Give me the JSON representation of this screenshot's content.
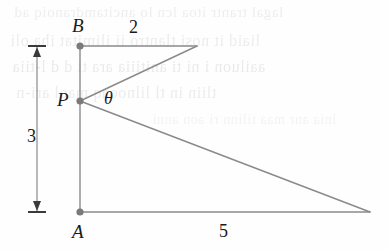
{
  "figure": {
    "background_color": "#fefefe",
    "stroke_color": "#8a8a8a",
    "dot_color": "#7a7a7a",
    "text_color": "#1a1a1a"
  },
  "points": {
    "A": {
      "label": "A",
      "x": 80,
      "y": 212,
      "label_x": 72,
      "label_y": 222
    },
    "B": {
      "label": "B",
      "x": 80,
      "y": 46,
      "label_x": 72,
      "label_y": 16
    },
    "P": {
      "label": "P",
      "x": 80,
      "y": 101,
      "label_x": 57,
      "label_y": 90
    },
    "C": {
      "label": "",
      "x": 197,
      "y": 46
    },
    "D": {
      "label": "",
      "x": 370,
      "y": 212
    }
  },
  "angle": {
    "label": "θ",
    "vertex": "P",
    "label_x": 104,
    "label_y": 89
  },
  "measurements": [
    {
      "name": "top-horizontal",
      "value": "2",
      "label_x": 129,
      "label_y": 18
    },
    {
      "name": "bottom-horizontal",
      "value": "5",
      "label_x": 219,
      "label_y": 222
    },
    {
      "name": "vertical-AB",
      "value": "3",
      "label_x": 27,
      "label_y": 127
    }
  ],
  "dimension_line": {
    "name": "height-dimension",
    "x": 37,
    "y_top": 46,
    "y_bottom": 212,
    "cap_half_width": 9,
    "value": "3"
  },
  "segments": [
    {
      "name": "segment-BA",
      "from": "B",
      "to": "A"
    },
    {
      "name": "segment-BC",
      "from": "B",
      "to": "C"
    },
    {
      "name": "segment-PC",
      "from": "P",
      "to": "C"
    },
    {
      "name": "segment-PD",
      "from": "P",
      "to": "D"
    },
    {
      "name": "segment-AD",
      "from": "A",
      "to": "D"
    }
  ],
  "ghost_text": {
    "description": "faint show-through text from reverse side of page",
    "lines": [
      {
        "text": "lagal  trantr  itoa  lcn  lo  ancitamdranoiq  ad",
        "x": 14,
        "y": 4,
        "size": 15,
        "opacity": 0.5
      },
      {
        "text": "liaid  it  nosi  tlantro  ii  ilimitat  iha  oli",
        "x": 10,
        "y": 32,
        "size": 16,
        "opacity": 0.55
      },
      {
        "text": "aailuon  i  ni  ti  anitiiia  ara  ti  d  d  l-tiia",
        "x": 12,
        "y": 58,
        "size": 16,
        "opacity": 0.6
      },
      {
        "text": "tliin  in  tl  lilnooaq  maol  ari-n",
        "x": 16,
        "y": 84,
        "size": 16,
        "opacity": 0.55
      },
      {
        "text": "lnia  anr  maa  tilinn  ri  aon  anni",
        "x": 152,
        "y": 112,
        "size": 14,
        "opacity": 0.35
      }
    ]
  }
}
